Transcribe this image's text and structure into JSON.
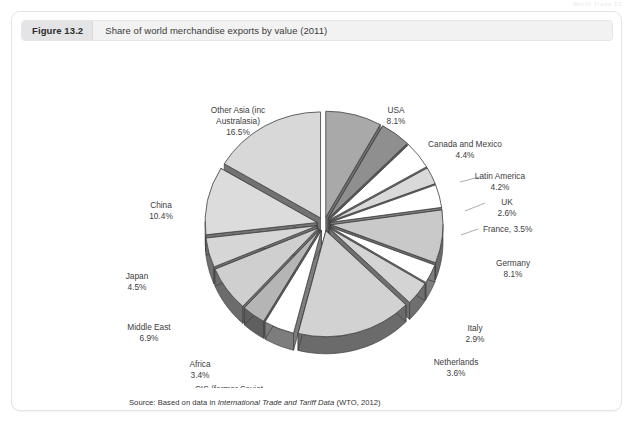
{
  "runhead": "World Trade 13",
  "figure": {
    "number": "Figure 13.2",
    "caption": "Share of world merchandise exports by value (2011)",
    "source_prefix": "Source: Based on data in ",
    "source_italic": "International Trade and Tariff Data",
    "source_suffix": " (WTO, 2012)"
  },
  "chart_data": {
    "type": "pie",
    "title": "Share of world merchandise exports by value (2011)",
    "unit": "%",
    "exploded": true,
    "three_d": true,
    "start_angle_deg": -90,
    "direction": "clockwise",
    "categories": [
      "USA",
      "Canada and Mexico",
      "Latin America",
      "UK",
      "France",
      "Germany",
      "Italy",
      "Netherlands",
      "Other Europe",
      "CIS (former Soviet republics)",
      "Africa",
      "Middle East",
      "Japan",
      "China",
      "Other Asia (inc Australasia)"
    ],
    "values": [
      8.1,
      4.4,
      4.2,
      2.6,
      3.5,
      8.1,
      2.9,
      3.6,
      16.7,
      4.4,
      3.4,
      6.9,
      4.5,
      10.4,
      16.5
    ],
    "slice_colors": [
      "#a9a9a9",
      "#8f8f8f",
      "#ffffff",
      "#d9d9d9",
      "#ffffff",
      "#c9c9c9",
      "#ffffff",
      "#d4d4d4",
      "#d2d2d2",
      "#ffffff",
      "#b5b5b5",
      "#cfcfcf",
      "#d6d6d6",
      "#dcdcdc",
      "#d8d8d8"
    ],
    "side_colors": [
      "#6e6e6e",
      "#5c5c5c",
      "#7d7d7d",
      "#7a7a7a",
      "#7d7d7d",
      "#6a6a6a",
      "#7d7d7d",
      "#6f6f6f",
      "#6b6b6b",
      "#7d7d7d",
      "#5f5f5f",
      "#6c6c6c",
      "#707070",
      "#737373",
      "#727272"
    ],
    "labels": [
      {
        "name": "USA",
        "value": "8.1%",
        "x": 383,
        "y": 70,
        "anchor": "middle"
      },
      {
        "name": "Canada and Mexico",
        "value": "4.4%",
        "x": 452,
        "y": 104,
        "anchor": "middle"
      },
      {
        "name": "Latin America",
        "value": "4.2%",
        "x": 487,
        "y": 136,
        "anchor": "middle"
      },
      {
        "name": "UK",
        "value": "2.6%",
        "x": 494,
        "y": 162,
        "anchor": "middle"
      },
      {
        "name": "France, 3.5%",
        "value": "",
        "x": 470,
        "y": 189,
        "anchor": "start"
      },
      {
        "name": "Germany",
        "value": "8.1%",
        "x": 500,
        "y": 223,
        "anchor": "middle"
      },
      {
        "name": "Italy",
        "value": "2.9%",
        "x": 462,
        "y": 288,
        "anchor": "middle"
      },
      {
        "name": "Netherlands",
        "value": "3.6%",
        "x": 443,
        "y": 322,
        "anchor": "middle"
      },
      {
        "name": "Other Europe",
        "value": "16.7%",
        "x": 352,
        "y": 358,
        "anchor": "middle"
      },
      {
        "name": "CIS (former Soviet",
        "name2": "republics)",
        "value": "4.4%",
        "x": 216,
        "y": 349,
        "anchor": "middle"
      },
      {
        "name": "Africa",
        "value": "3.4%",
        "x": 187,
        "y": 324,
        "anchor": "middle"
      },
      {
        "name": "Middle East",
        "value": "6.9%",
        "x": 136,
        "y": 287,
        "anchor": "middle"
      },
      {
        "name": "Japan",
        "value": "4.5%",
        "x": 124,
        "y": 236,
        "anchor": "middle"
      },
      {
        "name": "China",
        "value": "10.4%",
        "x": 148,
        "y": 165,
        "anchor": "middle"
      },
      {
        "name": "Other Asia (inc",
        "name2": "Australasia)",
        "value": "16.5%",
        "x": 225,
        "y": 70,
        "anchor": "middle"
      }
    ]
  }
}
